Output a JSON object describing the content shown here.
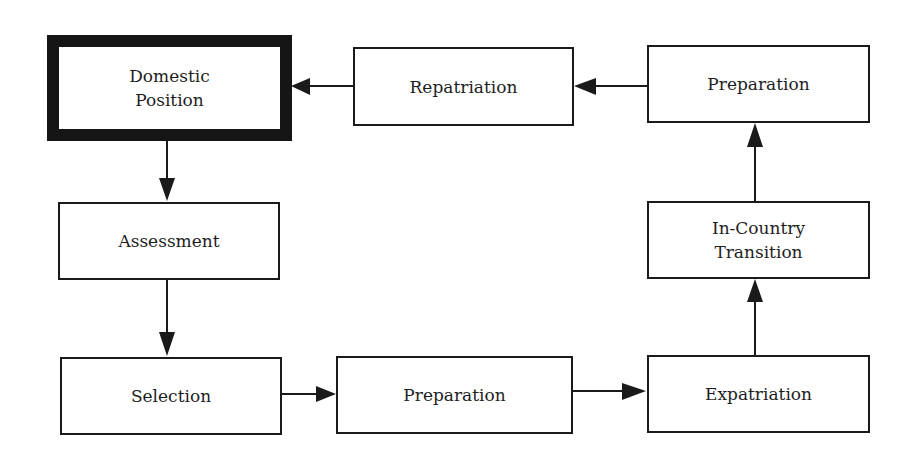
{
  "diagram": {
    "type": "flowchart-cycle",
    "nodes": [
      {
        "id": "domestic",
        "label": "Domestic\nPosition",
        "emphasized": true
      },
      {
        "id": "assessment",
        "label": "Assessment"
      },
      {
        "id": "selection",
        "label": "Selection"
      },
      {
        "id": "prep_bottom",
        "label": "Preparation"
      },
      {
        "id": "expatriation",
        "label": "Expatriation"
      },
      {
        "id": "in_country",
        "label": "In-Country\nTransition"
      },
      {
        "id": "prep_top",
        "label": "Preparation"
      },
      {
        "id": "repatriation",
        "label": "Repatriation"
      }
    ],
    "edges": [
      {
        "from": "domestic",
        "to": "assessment"
      },
      {
        "from": "assessment",
        "to": "selection"
      },
      {
        "from": "selection",
        "to": "prep_bottom"
      },
      {
        "from": "prep_bottom",
        "to": "expatriation"
      },
      {
        "from": "expatriation",
        "to": "in_country"
      },
      {
        "from": "in_country",
        "to": "prep_top"
      },
      {
        "from": "prep_top",
        "to": "repatriation"
      },
      {
        "from": "repatriation",
        "to": "domestic"
      }
    ],
    "colors": {
      "line": "#1a1a1a",
      "background": "#ffffff"
    }
  }
}
